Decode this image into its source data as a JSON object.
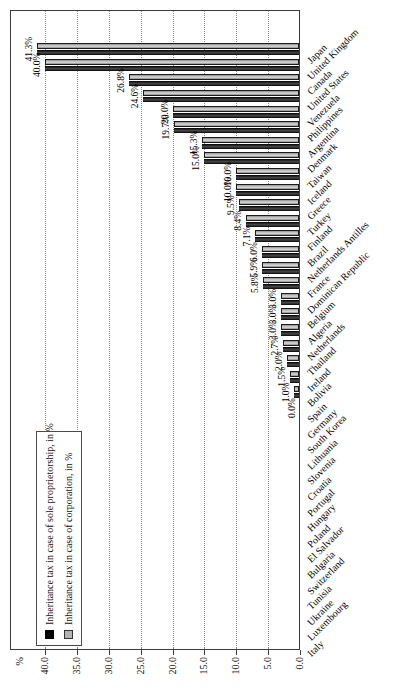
{
  "chart_data": {
    "type": "bar",
    "title": "",
    "unit_label": "%",
    "ylim": [
      0,
      40
    ],
    "grid": "dotted horizontal gridlines at each tick",
    "legend_position": "top-left inside plot",
    "yticks": [
      {
        "value": 0,
        "label": "0.0"
      },
      {
        "value": 5,
        "label": "5.0"
      },
      {
        "value": 10,
        "label": "10.0"
      },
      {
        "value": 15,
        "label": "15.0"
      },
      {
        "value": 20,
        "label": "20.0"
      },
      {
        "value": 25,
        "label": "25.0"
      },
      {
        "value": 30,
        "label": "30.0"
      },
      {
        "value": 35,
        "label": "35.0"
      },
      {
        "value": 40,
        "label": "40.0"
      }
    ],
    "series": [
      {
        "name": "Inheritance tax in case of sole proprietorship, in %",
        "color": "#000000"
      },
      {
        "name": "Inheritance tax in case of corporation, in %",
        "color": "#b3b3b3"
      }
    ],
    "series_note": "Both series are drawn side by side with equal values for every country; one value label per country",
    "countries": [
      {
        "name": "Japan",
        "value": 41.3,
        "label": "41.3%"
      },
      {
        "name": "United Kingdom",
        "value": 40.0,
        "label": "40.0%"
      },
      {
        "name": "Canada",
        "value": 26.8,
        "label": "26.8%"
      },
      {
        "name": "United States",
        "value": 24.6,
        "label": "24.6%"
      },
      {
        "name": "Venezuela",
        "value": 20.0,
        "label": "20.0%"
      },
      {
        "name": "Philippines",
        "value": 19.7,
        "label": "19.7%"
      },
      {
        "name": "Argentina",
        "value": 15.3,
        "label": "15.3%"
      },
      {
        "name": "Denmark",
        "value": 15.0,
        "label": "15.0%"
      },
      {
        "name": "Taiwan",
        "value": 10.0,
        "label": "10.0%"
      },
      {
        "name": "Iceland",
        "value": 10.0,
        "label": "10.0%"
      },
      {
        "name": "Greece",
        "value": 9.5,
        "label": "9.5%"
      },
      {
        "name": "Turkey",
        "value": 8.4,
        "label": "8.4%"
      },
      {
        "name": "Finland",
        "value": 7.1,
        "label": "7.1%"
      },
      {
        "name": "Brazil",
        "value": 6.0,
        "label": "6.0%"
      },
      {
        "name": "Netherlands Antilles",
        "value": 5.9,
        "label": "5.9%"
      },
      {
        "name": "France",
        "value": 5.8,
        "label": "5.8%"
      },
      {
        "name": "Dominican Republic",
        "value": 3.0,
        "label": "3.0%"
      },
      {
        "name": "Belgium",
        "value": 3.0,
        "label": "3.0%"
      },
      {
        "name": "Algeria",
        "value": 3.0,
        "label": "3.0%"
      },
      {
        "name": "Netherlands",
        "value": 2.7,
        "label": "2.7%"
      },
      {
        "name": "Thailand",
        "value": 2.0,
        "label": "2.0%"
      },
      {
        "name": "Ireland",
        "value": 1.5,
        "label": "1.5%"
      },
      {
        "name": "Bolivia",
        "value": 1.0,
        "label": "1.0%"
      },
      {
        "name": "Spain",
        "value": 0.0,
        "label": "0.0%"
      },
      {
        "name": "Germany",
        "value": 0.0,
        "label": ""
      },
      {
        "name": "South Korea",
        "value": 0.0,
        "label": ""
      },
      {
        "name": "Lithuania",
        "value": 0.0,
        "label": ""
      },
      {
        "name": "Slovenia",
        "value": 0.0,
        "label": ""
      },
      {
        "name": "Croatia",
        "value": 0.0,
        "label": ""
      },
      {
        "name": "Portugal",
        "value": 0.0,
        "label": ""
      },
      {
        "name": "Hungary",
        "value": 0.0,
        "label": ""
      },
      {
        "name": "Poland",
        "value": 0.0,
        "label": ""
      },
      {
        "name": "El Salvador",
        "value": 0.0,
        "label": ""
      },
      {
        "name": "Bulgaria",
        "value": 0.0,
        "label": ""
      },
      {
        "name": "Switzerland",
        "value": 0.0,
        "label": ""
      },
      {
        "name": "Tunisia",
        "value": 0.0,
        "label": ""
      },
      {
        "name": "Ukraine",
        "value": 0.0,
        "label": ""
      },
      {
        "name": "Luxembourg",
        "value": 0.0,
        "label": ""
      },
      {
        "name": "Italy",
        "value": 0.0,
        "label": ""
      }
    ]
  }
}
